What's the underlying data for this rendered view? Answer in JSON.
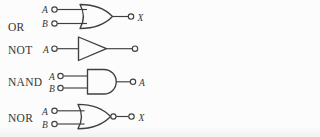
{
  "figure": {
    "type": "logic-gate-diagram",
    "rows": [
      {
        "gate": "or",
        "label": "OR",
        "inputs": [
          "A",
          "B"
        ],
        "output": "X"
      },
      {
        "gate": "not",
        "label": "NOT",
        "inputs": [
          "A"
        ],
        "output": ""
      },
      {
        "gate": "nand",
        "label": "NAND",
        "inputs": [
          "A",
          "B"
        ],
        "output": "A"
      },
      {
        "gate": "nor",
        "label": "NOR",
        "inputs": [
          "A",
          "B"
        ],
        "output": "X"
      }
    ],
    "colors": {
      "line": "#3f3f3f",
      "text": "#353535",
      "background": "#fcfcfc"
    }
  }
}
